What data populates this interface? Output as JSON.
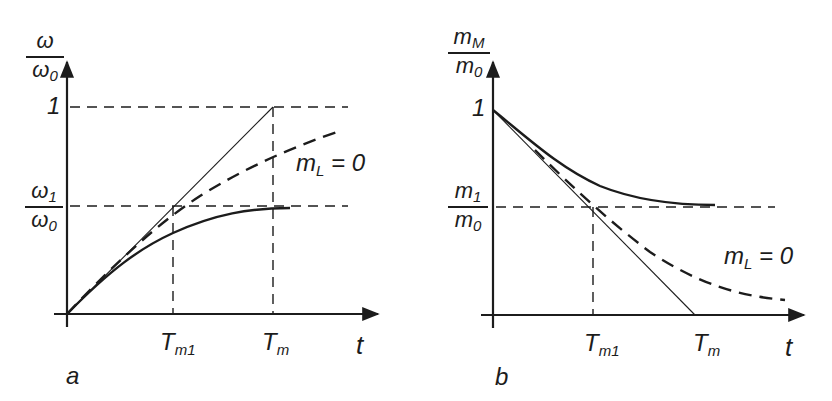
{
  "figure": {
    "panel_a": {
      "label": "a",
      "y_axis": {
        "num_base": "ω",
        "num_sub": "",
        "den_base": "ω",
        "den_sub": "0"
      },
      "y_tick_one": "1",
      "y_tick_ratio": {
        "num_base": "ω",
        "num_sub": "1",
        "den_base": "ω",
        "den_sub": "0"
      },
      "x_ticks": [
        {
          "base": "T",
          "sub": "m1"
        },
        {
          "base": "T",
          "sub": "m"
        }
      ],
      "x_axis_label": "t",
      "curve_label": {
        "base": "m",
        "sub": "L",
        "rest": " = 0"
      }
    },
    "panel_b": {
      "label": "b",
      "y_axis": {
        "num_base": "m",
        "num_sub": "M",
        "den_base": "m",
        "den_sub": "0"
      },
      "y_tick_one": "1",
      "y_tick_ratio": {
        "num_base": "m",
        "num_sub": "1",
        "den_base": "m",
        "den_sub": "0"
      },
      "x_ticks": [
        {
          "base": "T",
          "sub": "m1"
        },
        {
          "base": "T",
          "sub": "m"
        }
      ],
      "x_axis_label": "t",
      "curve_label": {
        "base": "m",
        "sub": "L",
        "rest": " = 0"
      }
    },
    "colors": {
      "ink": "#1c1c1c",
      "background": "#ffffff"
    }
  }
}
